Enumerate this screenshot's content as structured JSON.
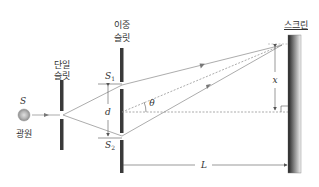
{
  "diagram": {
    "labels": {
      "source_symbol": "S",
      "source_name": "광원",
      "single_slit_line1": "단일",
      "single_slit_line2": "슬릿",
      "double_slit_line1": "이중",
      "double_slit_line2": "슬릿",
      "slit1": "S",
      "slit1_sub": "1",
      "slit2": "S",
      "slit2_sub": "2",
      "separation": "d",
      "angle": "θ",
      "screen": "스크린",
      "position": "x",
      "distance": "L"
    },
    "colors": {
      "slit_bar": "#3a3a3a",
      "ray": "#777777",
      "source_fill": "#b0b0b0",
      "screen_dark": "#222222",
      "screen_light": "#f2f2f2"
    }
  }
}
